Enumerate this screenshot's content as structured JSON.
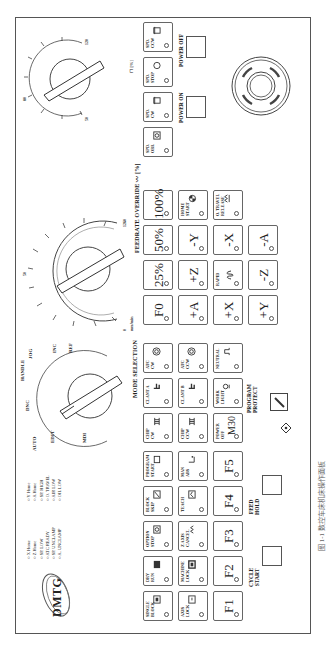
{
  "panel": {
    "brand": "DMTG",
    "caption": "图 1-1  数控车床机床操作面板"
  },
  "status_lights": {
    "column1": [
      "X Home",
      "Z Home",
      "SP. LOW",
      "ATC READY",
      "SP. UNCLAMP",
      "A. UNCLAMP"
    ],
    "column2": [
      "Y Home",
      "A Home",
      "SP. HIGH",
      "O. TRAVEL",
      "AIR LOW",
      "OIL LOW"
    ]
  },
  "function_keys": {
    "row1": [
      {
        "label": "SINGLE\nBLOCK",
        "icon": "single-block-icon"
      },
      {
        "label": "DRY\nRUN",
        "icon": "dry-run-icon"
      },
      {
        "label": "OPTION\nSTOP",
        "icon": "option-stop-icon"
      },
      {
        "label": "BLOCK\nSKIP",
        "icon": "block-skip-icon"
      },
      {
        "label": "PROGRAM\nSTART",
        "icon": "program-start-icon"
      }
    ],
    "row2": [
      {
        "label": "AXIS\nLOCK",
        "icon": "axis-lock-icon"
      },
      {
        "label": "MACHINE\nLOCK",
        "icon": "machine-lock-icon"
      },
      {
        "label": "Z AXIS\nCANCEL",
        "icon": "z-axis-cancel-icon"
      },
      {
        "label": "TEACH",
        "icon": "teach-icon"
      },
      {
        "label": "MAN\nABS",
        "icon": "man-abs-icon"
      }
    ],
    "row3": [
      "F1",
      "F2",
      "F3",
      "F4",
      "F5"
    ]
  },
  "cycle": {
    "cycle_start": "CYCLE\nSTART",
    "feed_hold": "FEED\nHOLD"
  },
  "mode_selector": {
    "title": "MODE SELECTION",
    "modes": [
      "AUTO",
      "EDIT",
      "MDI",
      "DNC",
      "HANDLE",
      "JOG",
      "INC",
      "REF"
    ],
    "selected": "DNC"
  },
  "aux_keys": {
    "row1": [
      {
        "label": "CLANT A",
        "icon": "coolant-icon"
      },
      {
        "label": "CLANT B",
        "icon": "coolant-icon"
      },
      {
        "label": "WORK\nLIGHT",
        "icon": "light-icon"
      }
    ],
    "row2": [
      {
        "label": "CHIP\nCW",
        "icon": "chip-conveyor-icon"
      },
      {
        "label": "CHIP\nCCW",
        "icon": "chip-conveyor-icon"
      },
      {
        "label": "POWER\nOFF",
        "big": "M30"
      }
    ],
    "row0": [
      {
        "label": "ATC\nCW",
        "icon": "atc-cw-icon"
      },
      {
        "label": "ATC\nCCW",
        "icon": "atc-ccw-icon"
      },
      {
        "label": "NEUTRAL",
        "icon": "neutral-icon"
      }
    ]
  },
  "program_protect": {
    "label": "PROGRAM\nPROTECT",
    "marks": [
      "0",
      "1"
    ]
  },
  "feedrate": {
    "title": "FEEDRATE OVERRIDE",
    "unit": "mm/min",
    "scale": [
      "0",
      "2",
      "3.2",
      "5",
      "7.9",
      "12.6",
      "20",
      "32",
      "50",
      "79",
      "126",
      "200",
      "320",
      "500",
      "790",
      "1260"
    ],
    "outer_scale": [
      "0",
      "2.0",
      "3.2",
      "5.0",
      "7.9",
      "12.6",
      "20",
      "32",
      "50",
      "79",
      "126",
      "200",
      "320",
      "500",
      "790",
      "1260"
    ],
    "percent_unit": "[%]"
  },
  "jog_keys": {
    "rapid_keys": [
      "F0",
      "25%",
      "50%",
      "100%"
    ],
    "axis_row1": [
      "+A",
      "+Z",
      "-Y"
    ],
    "home_start": "HOME\nSTART",
    "axis_row2": [
      "+X",
      "RAPID",
      "-X"
    ],
    "o_travel_release": "O. TRAVEL\nRELEASE",
    "axis_row3": [
      "+Y",
      "-Z",
      "-A"
    ]
  },
  "spindle": {
    "override_scale": [
      "50",
      "60",
      "70",
      "80",
      "90",
      "100",
      "110",
      "120"
    ],
    "override_unit": "[%]",
    "keys": [
      {
        "label": "SPD.\nORI.",
        "icon": "spindle-orient-icon"
      },
      {
        "label": "SPD.\nCW",
        "icon": "spindle-cw-icon"
      },
      {
        "label": "SPD.\nSTOP",
        "icon": "spindle-stop-icon"
      },
      {
        "label": "SPD.\nCCW",
        "icon": "spindle-ccw-icon"
      }
    ]
  },
  "power": {
    "on": "POWER ON",
    "off": "POWER OFF"
  },
  "emergency_stop": "emergency-stop"
}
